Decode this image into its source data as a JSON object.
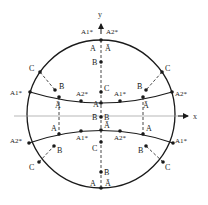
{
  "axes": {
    "x_label": "x",
    "y_label": "y"
  },
  "top": {
    "left_label": "A1*",
    "right_label": "A2*",
    "pole_left": "A",
    "pole_right": "Ā",
    "b_label": "B",
    "c_label": "C"
  },
  "upper_arc": {
    "left_end": "A1*",
    "right_end": "A2*",
    "left_mid": "Ā",
    "left_inner": "A2*",
    "center": "A",
    "right_inner": "A1*",
    "right_mid": "Ā"
  },
  "upper_left": {
    "c_label": "C",
    "b_label": "B̄"
  },
  "upper_right": {
    "c_label": "C",
    "b_label": "B̄"
  },
  "center": {
    "left": "B̄",
    "right": "B"
  },
  "lower_arc": {
    "left_end": "A2*",
    "right_end": "A1*",
    "left_mid": "A",
    "left_inner": "A1*",
    "center": "Ā",
    "right_inner": "A2*",
    "right_mid": "A"
  },
  "lower_left": {
    "c_label": "C",
    "b_label": "B"
  },
  "lower_right": {
    "c_label": "C",
    "b_label": "B"
  },
  "bottom": {
    "c_label": "C",
    "b_label": "B̄",
    "pole_left": "A",
    "pole_right": "Ā"
  },
  "colors": {
    "line": "#1a1a1a",
    "axis": "#888888"
  }
}
